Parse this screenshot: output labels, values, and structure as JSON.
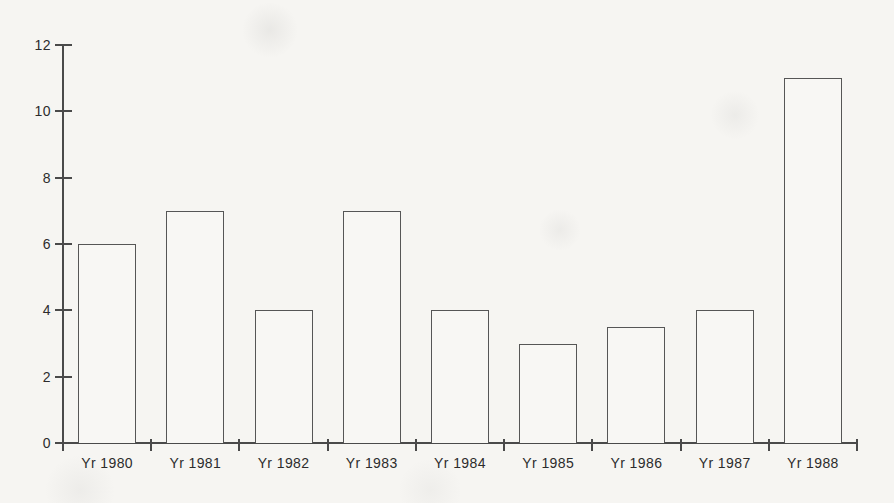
{
  "chart_data": {
    "type": "bar",
    "categories": [
      "Yr 1980",
      "Yr 1981",
      "Yr 1982",
      "Yr 1983",
      "Yr 1984",
      "Yr 1985",
      "Yr 1986",
      "Yr 1987",
      "Yr 1988"
    ],
    "values": [
      6,
      7,
      4,
      7,
      4,
      3,
      3.5,
      4,
      11
    ],
    "title": "",
    "xlabel": "",
    "ylabel": "",
    "ylim": [
      0,
      12
    ],
    "yticks": [
      0,
      2,
      4,
      6,
      8,
      10,
      12
    ],
    "grid": false,
    "legend": "none",
    "bar_fill": "#f8f7f4",
    "bar_border": "#565656",
    "axis_color": "#4a4a4a",
    "text_color": "#2c2c2c",
    "background": "#f6f5f2"
  }
}
